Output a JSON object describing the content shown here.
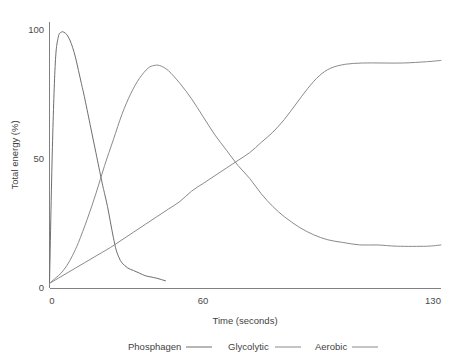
{
  "chart_data": {
    "type": "line",
    "title": "",
    "xlabel": "Time (seconds)",
    "ylabel": "Total energy (%)",
    "xlim": [
      0,
      135
    ],
    "ylim": [
      0,
      104
    ],
    "xticks": [
      0,
      60,
      130
    ],
    "xtick_labels": [
      "0",
      "60",
      "130"
    ],
    "yticks": [
      0,
      50,
      100
    ],
    "ytick_labels": [
      "0",
      "50",
      "100"
    ],
    "grid": false,
    "legend_position": "bottom",
    "series": [
      {
        "name": "Phosphagen",
        "color": "#6e6e6e",
        "x": [
          0,
          1,
          2,
          3,
          4,
          5,
          6,
          7,
          8,
          9,
          10,
          11,
          12,
          14,
          16,
          18,
          19,
          20,
          21,
          22,
          23,
          24,
          25,
          27,
          29,
          31,
          33,
          35,
          37,
          40
        ],
        "y": [
          2,
          55,
          88,
          98,
          100,
          100,
          99,
          97,
          94,
          90,
          85,
          80,
          75,
          64,
          53,
          42,
          37,
          32,
          26,
          20,
          15,
          12,
          10,
          8,
          7,
          6,
          5,
          4.5,
          4,
          3
        ]
      },
      {
        "name": "Glycolytic",
        "color": "#8a8a8a",
        "x": [
          0,
          2,
          4,
          6,
          8,
          10,
          13,
          16,
          19,
          22,
          25,
          28,
          31,
          34,
          36,
          38,
          41,
          45,
          49,
          53,
          57,
          61,
          65,
          69,
          73,
          77,
          81,
          86,
          91,
          96,
          101,
          107,
          113,
          120,
          130,
          135
        ],
        "y": [
          2,
          4,
          6,
          9,
          13,
          18,
          27,
          37,
          48,
          58,
          68,
          76,
          82,
          86,
          87,
          87,
          85,
          80,
          74,
          67,
          60,
          54,
          48,
          43,
          37,
          32,
          28,
          24,
          21,
          19,
          18,
          17,
          17,
          16.5,
          16.5,
          17
        ]
      },
      {
        "name": "Aerobic",
        "color": "#8a8a8a",
        "x": [
          0,
          3,
          6,
          9,
          12,
          15,
          18,
          21,
          25,
          29,
          33,
          37,
          41,
          45,
          49,
          53,
          57,
          61,
          65,
          69,
          73,
          77,
          81,
          85,
          89,
          93,
          97,
          102,
          108,
          115,
          122,
          130,
          135
        ],
        "y": [
          2,
          4,
          6,
          8,
          10,
          12,
          14,
          16,
          19,
          22,
          25,
          28,
          31,
          34,
          38,
          41,
          44,
          47,
          50,
          53,
          57,
          61,
          66,
          72,
          78,
          83,
          86,
          87.5,
          88,
          88,
          88,
          88.5,
          89
        ]
      }
    ],
    "legend_entries": [
      {
        "label": "Phosphagen",
        "color": "#6e6e6e"
      },
      {
        "label": "Glycolytic",
        "color": "#8a8a8a"
      },
      {
        "label": "Aerobic",
        "color": "#8a8a8a"
      }
    ],
    "axis_color": "#808080",
    "background_color": "#ffffff"
  }
}
